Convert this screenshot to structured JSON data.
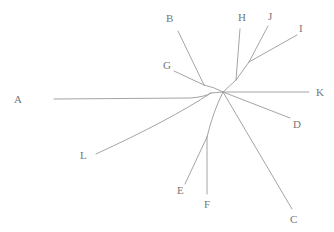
{
  "figure": {
    "background_color": "#ffffff",
    "line_color": "#9a9a9a",
    "label_color": "#777777",
    "width": 334,
    "height": 232
  },
  "chart_data": {
    "type": "scatter",
    "xlabel": "",
    "ylabel": "",
    "layout": "unrooted-radial",
    "grid": false,
    "legend": false,
    "root": {
      "name": "center-hub",
      "x": 223,
      "y": 92
    },
    "internal_nodes": [
      {
        "id": "n-bg",
        "x": 204,
        "y": 85,
        "joins": [
          "B",
          "G"
        ]
      },
      {
        "id": "n-al",
        "x": 211,
        "y": 93,
        "joins": [
          "A",
          "L"
        ]
      },
      {
        "id": "n-ji",
        "x": 249,
        "y": 62,
        "joins": [
          "J",
          "I"
        ]
      },
      {
        "id": "n-hji",
        "x": 236,
        "y": 80,
        "joins": [
          "H",
          "n-ji"
        ]
      },
      {
        "id": "n-ef",
        "x": 207,
        "y": 137,
        "joins": [
          "E",
          "F"
        ]
      }
    ],
    "taxa": [
      {
        "label": "A",
        "tip_x": 54,
        "tip_y": 99,
        "label_x": 14,
        "label_y": 103
      },
      {
        "label": "B",
        "tip_x": 178,
        "tip_y": 31,
        "label_x": 166,
        "label_y": 22
      },
      {
        "label": "C",
        "tip_x": 292,
        "tip_y": 209,
        "label_x": 290,
        "label_y": 223
      },
      {
        "label": "D",
        "tip_x": 290,
        "tip_y": 118,
        "label_x": 293,
        "label_y": 128
      },
      {
        "label": "E",
        "tip_x": 185,
        "tip_y": 184,
        "label_x": 177,
        "label_y": 194
      },
      {
        "label": "F",
        "tip_x": 207,
        "tip_y": 194,
        "label_x": 204,
        "label_y": 208
      },
      {
        "label": "G",
        "tip_x": 174,
        "tip_y": 71,
        "label_x": 163,
        "label_y": 69
      },
      {
        "label": "H",
        "tip_x": 240,
        "tip_y": 29,
        "label_x": 238,
        "label_y": 21
      },
      {
        "label": "I",
        "tip_x": 297,
        "tip_y": 35,
        "label_x": 299,
        "label_y": 32
      },
      {
        "label": "J",
        "tip_x": 268,
        "tip_y": 26,
        "label_x": 268,
        "label_y": 20
      },
      {
        "label": "K",
        "tip_x": 309,
        "tip_y": 92,
        "label_x": 316,
        "label_y": 96
      },
      {
        "label": "L",
        "tip_x": 96,
        "tip_y": 154,
        "label_x": 80,
        "label_y": 159
      }
    ],
    "branches": [
      {
        "name": "branch-A",
        "taxon": "A",
        "path": "M 54 99 L 190 98 Q 205 97 211 93"
      },
      {
        "name": "branch-L",
        "taxon": "L",
        "path": "M 96 154 Q 170 120 211 93"
      },
      {
        "name": "branch-al-hub",
        "taxon": null,
        "path": "M 211 93 L 223 92"
      },
      {
        "name": "branch-B",
        "taxon": "B",
        "path": "M 178 31 L 204 85"
      },
      {
        "name": "branch-G",
        "taxon": "G",
        "path": "M 174 71 L 204 85"
      },
      {
        "name": "branch-bg-hub",
        "taxon": null,
        "path": "M 204 85 Q 214 87 223 92"
      },
      {
        "name": "branch-H",
        "taxon": "H",
        "path": "M 240 29 L 236 80"
      },
      {
        "name": "branch-J",
        "taxon": "J",
        "path": "M 268 26 L 249 62"
      },
      {
        "name": "branch-I",
        "taxon": "I",
        "path": "M 297 35 L 249 62"
      },
      {
        "name": "branch-ji-hji",
        "taxon": null,
        "path": "M 249 62 L 236 80"
      },
      {
        "name": "branch-hji-hub",
        "taxon": null,
        "path": "M 236 80 L 223 92"
      },
      {
        "name": "branch-K",
        "taxon": "K",
        "path": "M 309 92 L 223 92"
      },
      {
        "name": "branch-D",
        "taxon": "D",
        "path": "M 290 118 L 223 92"
      },
      {
        "name": "branch-C",
        "taxon": "C",
        "path": "M 292 209 L 223 92"
      },
      {
        "name": "branch-F",
        "taxon": "F",
        "path": "M 207 194 L 207 137"
      },
      {
        "name": "branch-E",
        "taxon": "E",
        "path": "M 185 184 L 207 137"
      },
      {
        "name": "branch-ef-hub",
        "taxon": null,
        "path": "M 207 137 Q 213 112 223 92"
      }
    ]
  }
}
